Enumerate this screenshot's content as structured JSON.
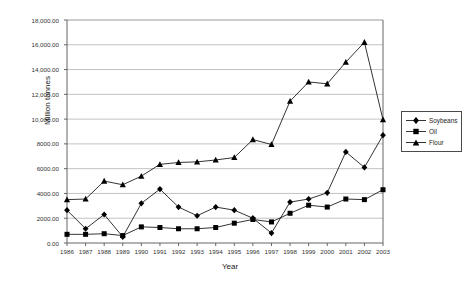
{
  "chart_data": {
    "type": "line",
    "title": "",
    "xlabel": "Year",
    "ylabel": "Million tonnes",
    "grid": true,
    "legend_position": "right",
    "xlim": [
      1986,
      2003
    ],
    "ylim": [
      0,
      18000
    ],
    "ytick_step": 2000,
    "ytick_labels": [
      "18,000.00",
      "16,000.00",
      "14,000.00",
      "12,000.00",
      "10,000.00",
      "8000.00",
      "6000.00",
      "4000.00",
      "2000.00",
      "0.00"
    ],
    "ytick_values": [
      18000,
      16000,
      14000,
      12000,
      10000,
      8000,
      6000,
      4000,
      2000,
      0
    ],
    "categories": [
      "1986",
      "1987",
      "1988",
      "1989",
      "1990",
      "1991",
      "1992",
      "1993",
      "1994",
      "1995",
      "1996",
      "1997",
      "1998",
      "1999",
      "2000",
      "2001",
      "2002",
      "2003"
    ],
    "series": [
      {
        "name": "Soybeans",
        "marker": "diamond",
        "values": [
          2650,
          1150,
          2300,
          500,
          3200,
          4350,
          2900,
          2200,
          2900,
          2650,
          2000,
          800,
          3300,
          3550,
          4050,
          7350,
          6100,
          8700
        ]
      },
      {
        "name": "Oil",
        "marker": "square",
        "values": [
          700,
          700,
          750,
          600,
          1300,
          1250,
          1150,
          1150,
          1250,
          1600,
          1900,
          1700,
          2400,
          3050,
          2900,
          3550,
          3500,
          4300
        ]
      },
      {
        "name": "Flour",
        "marker": "triangle",
        "values": [
          3500,
          3550,
          5000,
          4700,
          5400,
          6350,
          6500,
          6550,
          6700,
          6900,
          8350,
          7950,
          11450,
          13000,
          12850,
          14600,
          16200,
          9950
        ]
      }
    ]
  },
  "legend": {
    "entries": [
      {
        "label": "Soybeans"
      },
      {
        "label": "Oil"
      },
      {
        "label": "Flour"
      }
    ]
  },
  "colors": {
    "series": "#000000",
    "grid": "#a8a8a8",
    "axis": "#555555",
    "text": "#222222",
    "background": "#ffffff"
  }
}
